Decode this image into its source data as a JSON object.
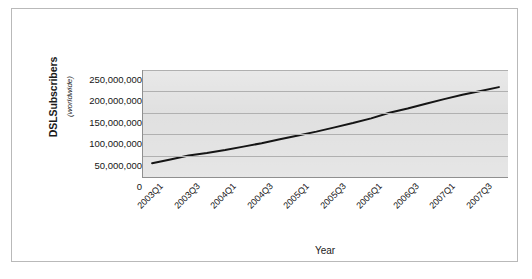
{
  "figure": {
    "border_color": "#b9b9b9",
    "plot_bg_color": "#d9d9d9",
    "line_color": "#151515"
  },
  "chart_data": {
    "type": "line",
    "title": "",
    "xlabel": "Year",
    "ylabel": "DSLSubscribers",
    "ylabel_sub": "(worldwide)",
    "ylim": [
      0,
      250000000
    ],
    "ytick_labels": [
      "250,000,000",
      "200,000,000",
      "150,000,000",
      "100,000,000",
      "50,000,000",
      "0"
    ],
    "ytick_values": [
      250000000,
      200000000,
      150000000,
      100000000,
      50000000,
      0
    ],
    "grid": true,
    "legend": false,
    "categories": [
      "2003Q1",
      "2003Q2",
      "2003Q3",
      "2003Q4",
      "2004Q1",
      "2004Q2",
      "2004Q3",
      "2004Q4",
      "2005Q1",
      "2005Q2",
      "2005Q3",
      "2005Q4",
      "2006Q1",
      "2006Q2",
      "2006Q3",
      "2006Q4",
      "2007Q1",
      "2007Q2",
      "2007Q3",
      "2007Q4"
    ],
    "xtick_labels": [
      "2003Q1",
      "2003Q3",
      "2004Q1",
      "2004Q3",
      "2005Q1",
      "2005Q3",
      "2006Q1",
      "2006Q3",
      "2007Q1",
      "2007Q3"
    ],
    "values": [
      32000000,
      41000000,
      50000000,
      56000000,
      63000000,
      71000000,
      79000000,
      88000000,
      97000000,
      106000000,
      116000000,
      126000000,
      137000000,
      150000000,
      160000000,
      171000000,
      182000000,
      192000000,
      201000000,
      210000000
    ],
    "series": [
      {
        "name": "DSL Subscribers (worldwide)",
        "values": [
          32000000,
          41000000,
          50000000,
          56000000,
          63000000,
          71000000,
          79000000,
          88000000,
          97000000,
          106000000,
          116000000,
          126000000,
          137000000,
          150000000,
          160000000,
          171000000,
          182000000,
          192000000,
          201000000,
          210000000
        ]
      }
    ]
  }
}
